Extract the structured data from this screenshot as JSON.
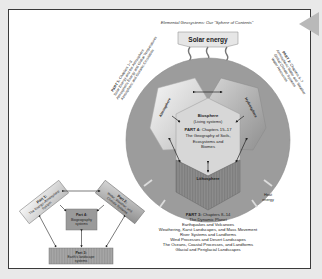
{
  "title": "Elemental Geosystems: Our \"Sphere of Contents\"",
  "solar_energy": "Solar energy",
  "heat_energy": [
    "Heat",
    "energy"
  ],
  "spheres": {
    "atmosphere": "Atmosphere",
    "hydrosphere": "Hydrosphere",
    "biosphere_title": "Biosphere",
    "biosphere_sub": "(Living systems)",
    "lithosphere": "Lithosphere"
  },
  "part4_inside": {
    "bold": "PART 4:",
    "rest": "Chapters 15–17",
    "lines": [
      "The Geography of Soils,",
      "Ecosystems and",
      "Biomes"
    ]
  },
  "part1": {
    "bold": "PART 1:",
    "rest": "Chapters 1–3",
    "lines": [
      "Solar Energy and the Atmosphere",
      "Atmospheric Energy and Global Temperatures",
      "Atmospheric and Oceanic Circulation"
    ]
  },
  "part2": {
    "bold": "PART 2:",
    "rest": "Chapters 5–7",
    "lines": [
      "Atmospheric Water and Weather",
      "Global Climate Systems",
      "Water Resources"
    ]
  },
  "part3": {
    "bold": "PART 3:",
    "rest": "Chapters 8–14",
    "lines": [
      "The Dynamic Planet",
      "Earthquakes and Volcanoes",
      "Weathering, Karst Landscapes, and Mass Movement",
      "River Systems and Landforms",
      "Wind Processes and Desert Landscapes",
      "The Oceans, Coastal Processes, and Landforms",
      "Glacial and Periglacial Landscapes"
    ]
  },
  "mini": {
    "part1": [
      "Part 1:",
      "The Energy–Atmosphere",
      "System"
    ],
    "part2": [
      "Part 2:",
      "Water, Weather, and",
      "Climate Systems"
    ],
    "part4": [
      "Part 4:",
      "Biogeography",
      "systems"
    ],
    "part3": [
      "Part 3:",
      "Earth's landscape",
      "systems"
    ]
  },
  "colors": {
    "globe": "#9c9c9c",
    "atmosphere": "#eeeeee",
    "hydrosphere": "#bdbdbd",
    "biosphere": "#d4d4d4",
    "lithosphere": "#8a8a8a",
    "solar_box": "#e6e6e6",
    "frame_border": "#3a3a3a"
  }
}
